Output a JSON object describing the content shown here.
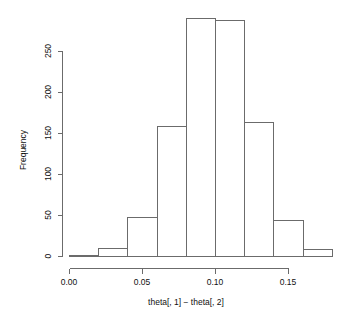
{
  "chart_data": {
    "type": "bar",
    "subtype": "histogram",
    "title": "",
    "xlabel": "theta[, 1] − theta[, 2]",
    "ylabel": "Frequency",
    "bin_width": 0.02,
    "bin_edges": [
      0.0,
      0.02,
      0.04,
      0.06,
      0.08,
      0.1,
      0.12,
      0.14,
      0.16,
      0.18
    ],
    "categories": [
      "0.00–0.02",
      "0.02–0.04",
      "0.04–0.06",
      "0.06–0.08",
      "0.08–0.10",
      "0.10–0.12",
      "0.12–0.14",
      "0.14–0.16",
      "0.16–0.18"
    ],
    "values": [
      1,
      10,
      48,
      159,
      290,
      288,
      163,
      44,
      9
    ],
    "xlim": [
      0.0,
      0.18
    ],
    "ylim": [
      0,
      290
    ],
    "xticks": [
      0.0,
      0.05,
      0.1,
      0.15
    ],
    "xticklabels": [
      "0.00",
      "0.05",
      "0.10",
      "0.15"
    ],
    "yticks": [
      0,
      50,
      100,
      150,
      200,
      250
    ],
    "yticklabels": [
      "0",
      "50",
      "100",
      "150",
      "200",
      "250"
    ],
    "grid": false,
    "legend": false,
    "bar_fill": "#ffffff",
    "bar_stroke": "#6b6b6b",
    "axis_color": "#6b6b6b",
    "background": "#ffffff"
  }
}
